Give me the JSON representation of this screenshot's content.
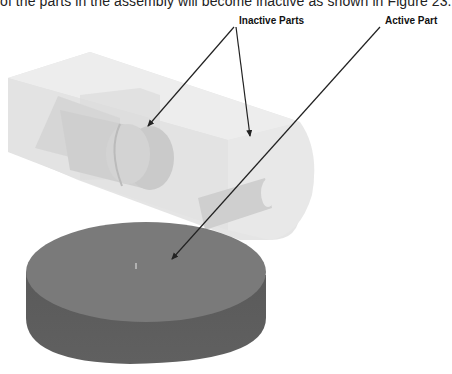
{
  "document": {
    "body_text_cut": "of the parts in the assembly will become inactive as shown in Figure 23.",
    "figure": {
      "callouts": {
        "inactive": "Inactive Parts",
        "active": "Active Part"
      },
      "colors": {
        "inactive_part": "#dcdcdc",
        "active_part_top": "#7a7a7a",
        "active_part_side": "#5e5e5e",
        "arrow": "#222222"
      }
    }
  }
}
